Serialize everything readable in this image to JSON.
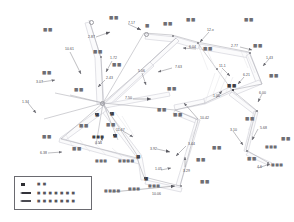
{
  "figure": {
    "type": "survey-network-diagram",
    "width": 294,
    "height": 222,
    "background": "#ffffff",
    "line_color": "#b9b9c0",
    "text_color": "#55555b"
  },
  "measurements": [
    {
      "id": "m01",
      "value": "7.17",
      "x": 128,
      "y": 22
    },
    {
      "id": "m02",
      "value": "2.87",
      "x": 88,
      "y": 36
    },
    {
      "id": "m03",
      "value": "10.61",
      "x": 65,
      "y": 48
    },
    {
      "id": "m04",
      "value": "1.72",
      "x": 110,
      "y": 57
    },
    {
      "id": "m05",
      "value": "12.x",
      "x": 207,
      "y": 29
    },
    {
      "id": "m06",
      "value": "6.04",
      "x": 189,
      "y": 46
    },
    {
      "id": "m07",
      "value": "2.77",
      "x": 231,
      "y": 45
    },
    {
      "id": "m08",
      "value": "1.43",
      "x": 266,
      "y": 57
    },
    {
      "id": "m09",
      "value": "5.06",
      "x": 138,
      "y": 70
    },
    {
      "id": "m10",
      "value": "7.63",
      "x": 175,
      "y": 66
    },
    {
      "id": "m11",
      "value": "11.1",
      "x": 219,
      "y": 65
    },
    {
      "id": "m12",
      "value": "6.21",
      "x": 243,
      "y": 74
    },
    {
      "id": "m13",
      "value": "2.43",
      "x": 106,
      "y": 77
    },
    {
      "id": "m14",
      "value": "3.07",
      "x": 36,
      "y": 81
    },
    {
      "id": "m15",
      "value": "7.50",
      "x": 125,
      "y": 97
    },
    {
      "id": "m16",
      "value": "1.00",
      "x": 213,
      "y": 95
    },
    {
      "id": "m17",
      "value": "6.00",
      "x": 259,
      "y": 92
    },
    {
      "id": "m18",
      "value": "1.34",
      "x": 22,
      "y": 101
    },
    {
      "id": "m19",
      "value": "10.42",
      "x": 200,
      "y": 117
    },
    {
      "id": "m20",
      "value": "11.67",
      "x": 116,
      "y": 129
    },
    {
      "id": "m21",
      "value": "0.54",
      "x": 95,
      "y": 142
    },
    {
      "id": "m22",
      "value": "5.68",
      "x": 260,
      "y": 127
    },
    {
      "id": "m23",
      "value": "3.10",
      "x": 230,
      "y": 129
    },
    {
      "id": "m24",
      "value": "6.38",
      "x": 40,
      "y": 152
    },
    {
      "id": "m25",
      "value": "3.44",
      "x": 188,
      "y": 143
    },
    {
      "id": "m26",
      "value": "3.92",
      "x": 150,
      "y": 148
    },
    {
      "id": "m27",
      "value": "3.29",
      "x": 183,
      "y": 170
    },
    {
      "id": "m28",
      "value": "1.05",
      "x": 155,
      "y": 168
    },
    {
      "id": "m29",
      "value": "10.06",
      "x": 152,
      "y": 193
    },
    {
      "id": "m30",
      "value": "4.6",
      "x": 257,
      "y": 166
    }
  ],
  "annotations": [
    {
      "id": "a01",
      "text": "■■",
      "x": 43,
      "y": 28,
      "size": "normal",
      "tone": "light"
    },
    {
      "id": "a02",
      "text": "■■",
      "x": 109,
      "y": 16,
      "size": "normal",
      "tone": "light"
    },
    {
      "id": "a03",
      "text": "■■",
      "x": 163,
      "y": 22,
      "size": "normal",
      "tone": "light"
    },
    {
      "id": "a04",
      "text": "■■",
      "x": 186,
      "y": 18,
      "size": "normal",
      "tone": "light"
    },
    {
      "id": "a05",
      "text": "■",
      "x": 145,
      "y": 24,
      "size": "normal",
      "tone": "light"
    },
    {
      "id": "a06",
      "text": "■■",
      "x": 93,
      "y": 50,
      "size": "normal",
      "tone": "light"
    },
    {
      "id": "a07",
      "text": "■■",
      "x": 112,
      "y": 63,
      "size": "normal",
      "tone": "light"
    },
    {
      "id": "a08",
      "text": "■■",
      "x": 42,
      "y": 71,
      "size": "normal",
      "tone": "light"
    },
    {
      "id": "a09",
      "text": "■■",
      "x": 74,
      "y": 88,
      "size": "normal",
      "tone": "light"
    },
    {
      "id": "a10",
      "text": "■■",
      "x": 244,
      "y": 18,
      "size": "normal",
      "tone": "light"
    },
    {
      "id": "a11",
      "text": "■■",
      "x": 203,
      "y": 47,
      "size": "normal",
      "tone": "light"
    },
    {
      "id": "a12",
      "text": "■■",
      "x": 253,
      "y": 44,
      "size": "normal",
      "tone": "light"
    },
    {
      "id": "a13",
      "text": "■■",
      "x": 269,
      "y": 74,
      "size": "normal",
      "tone": "light"
    },
    {
      "id": "a14",
      "text": "■■",
      "x": 167,
      "y": 87,
      "size": "normal",
      "tone": "light"
    },
    {
      "id": "a15",
      "text": "■■",
      "x": 227,
      "y": 84,
      "size": "normal",
      "tone": "dark"
    },
    {
      "id": "a16",
      "text": "■■",
      "x": 157,
      "y": 108,
      "size": "normal",
      "tone": "light"
    },
    {
      "id": "a17",
      "text": "■",
      "x": 95,
      "y": 113,
      "size": "normal",
      "tone": "dark"
    },
    {
      "id": "a18",
      "text": "■",
      "x": 110,
      "y": 112,
      "size": "normal",
      "tone": "dark"
    },
    {
      "id": "a19",
      "text": "■■",
      "x": 79,
      "y": 124,
      "size": "normal",
      "tone": "light"
    },
    {
      "id": "a20",
      "text": "■■",
      "x": 106,
      "y": 123,
      "size": "normal",
      "tone": "light"
    },
    {
      "id": "a21",
      "text": "■■■",
      "x": 92,
      "y": 135,
      "size": "tiny",
      "tone": "dark"
    },
    {
      "id": "a22",
      "text": "■",
      "x": 113,
      "y": 134,
      "size": "normal",
      "tone": "dark"
    },
    {
      "id": "a23",
      "text": "■■",
      "x": 42,
      "y": 135,
      "size": "normal",
      "tone": "light"
    },
    {
      "id": "a24",
      "text": "■■■",
      "x": 95,
      "y": 159,
      "size": "tiny",
      "tone": "light"
    },
    {
      "id": "a25",
      "text": "■■■■",
      "x": 118,
      "y": 159,
      "size": "tiny",
      "tone": "light"
    },
    {
      "id": "a26",
      "text": "■",
      "x": 136,
      "y": 155,
      "size": "normal",
      "tone": "dark"
    },
    {
      "id": "a27",
      "text": "■■■■",
      "x": 104,
      "y": 189,
      "size": "tiny",
      "tone": "light"
    },
    {
      "id": "a28",
      "text": "■■■",
      "x": 128,
      "y": 187,
      "size": "tiny",
      "tone": "light"
    },
    {
      "id": "a29",
      "text": "■",
      "x": 144,
      "y": 177,
      "size": "normal",
      "tone": "dark"
    },
    {
      "id": "a30",
      "text": "■■■",
      "x": 148,
      "y": 184,
      "size": "tiny",
      "tone": "light"
    },
    {
      "id": "a31",
      "text": "■■",
      "x": 200,
      "y": 180,
      "size": "normal",
      "tone": "light"
    },
    {
      "id": "a32",
      "text": "■■",
      "x": 196,
      "y": 158,
      "size": "normal",
      "tone": "light"
    },
    {
      "id": "a33",
      "text": "■■",
      "x": 247,
      "y": 157,
      "size": "normal",
      "tone": "light"
    },
    {
      "id": "a34",
      "text": "■■■",
      "x": 271,
      "y": 163,
      "size": "tiny",
      "tone": "light"
    },
    {
      "id": "a35",
      "text": "■■",
      "x": 245,
      "y": 117,
      "size": "normal",
      "tone": "light"
    },
    {
      "id": "a36",
      "text": "■■■",
      "x": 265,
      "y": 145,
      "size": "tiny",
      "tone": "light"
    },
    {
      "id": "a37",
      "text": "■■",
      "x": 281,
      "y": 137,
      "size": "normal",
      "tone": "light"
    },
    {
      "id": "a38",
      "text": "■■",
      "x": 173,
      "y": 113,
      "size": "normal",
      "tone": "light"
    },
    {
      "id": "a39",
      "text": "■■",
      "x": 212,
      "y": 146,
      "size": "normal",
      "tone": "light"
    },
    {
      "id": "a40",
      "text": "■■",
      "x": 72,
      "y": 147,
      "size": "normal",
      "tone": "light"
    }
  ],
  "legend": {
    "title": "",
    "rows": [
      {
        "id": "leg1",
        "symbol": "point-marker",
        "label": "■ ■"
      },
      {
        "id": "leg2",
        "symbol": "arrow-bar-dark",
        "label": "■ ■ ■ ■ ■ ■ ■"
      },
      {
        "id": "leg3",
        "symbol": "arrow-bar-mid",
        "label": "■ ■ ■ ■ ■ ■ ■"
      }
    ]
  },
  "nodes": [
    {
      "id": "n01",
      "x": 89,
      "y": 20,
      "kind": "ring"
    },
    {
      "id": "n02",
      "x": 144,
      "y": 32,
      "kind": "ring"
    },
    {
      "id": "n03",
      "x": 172,
      "y": 35,
      "kind": "dot"
    },
    {
      "id": "n04",
      "x": 197,
      "y": 42,
      "kind": "dot"
    },
    {
      "id": "n05",
      "x": 249,
      "y": 52,
      "kind": "dot"
    },
    {
      "id": "n06",
      "x": 100,
      "y": 56,
      "kind": "dot"
    },
    {
      "id": "n07",
      "x": 100,
      "y": 101,
      "kind": "ring"
    },
    {
      "id": "n08",
      "x": 232,
      "y": 89,
      "kind": "sq"
    },
    {
      "id": "n09",
      "x": 216,
      "y": 68,
      "kind": "dot"
    },
    {
      "id": "n10",
      "x": 256,
      "y": 110,
      "kind": "dot"
    },
    {
      "id": "n11",
      "x": 246,
      "y": 150,
      "kind": "dot"
    },
    {
      "id": "n12",
      "x": 137,
      "y": 155,
      "kind": "sq"
    },
    {
      "id": "n13",
      "x": 144,
      "y": 177,
      "kind": "sq"
    },
    {
      "id": "n14",
      "x": 95,
      "y": 113,
      "kind": "sq"
    },
    {
      "id": "n15",
      "x": 110,
      "y": 112,
      "kind": "sq"
    },
    {
      "id": "n16",
      "x": 113,
      "y": 134,
      "kind": "sq"
    },
    {
      "id": "n17",
      "x": 180,
      "y": 185,
      "kind": "dot"
    },
    {
      "id": "n18",
      "x": 267,
      "y": 162,
      "kind": "dot"
    }
  ]
}
